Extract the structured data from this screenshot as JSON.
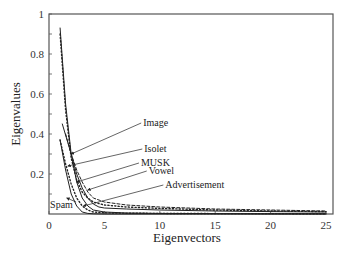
{
  "chart_data": {
    "type": "line",
    "title": "",
    "xlabel": "Eigenvectors",
    "ylabel": "Eigenvalues",
    "xlim": [
      0,
      25
    ],
    "ylim": [
      0,
      1
    ],
    "xticks": [
      0,
      5,
      10,
      15,
      20,
      25
    ],
    "xtick_labels": [
      "0",
      "5",
      "10",
      "15",
      "20",
      "25"
    ],
    "yticks": [
      0.2,
      0.4,
      0.6,
      0.8,
      1
    ],
    "ytick_labels": [
      "0.2",
      "0.4",
      "0.6",
      "0.8",
      "1"
    ],
    "grid": false,
    "legend": "none (inline annotations with arrows)",
    "series": [
      {
        "name": "Image",
        "style": "solid",
        "x": [
          1,
          1.5,
          2,
          2.5,
          3,
          3.5,
          4,
          5,
          7,
          10,
          15,
          20,
          25
        ],
        "y": [
          0.93,
          0.55,
          0.3,
          0.16,
          0.08,
          0.04,
          0.02,
          0.01,
          0.005,
          0.003,
          0.002,
          0.001,
          0.001
        ]
      },
      {
        "name": "Isolet",
        "style": "dotted",
        "x": [
          1,
          1.5,
          2,
          2.5,
          3,
          3.5,
          4,
          5,
          7,
          10,
          15,
          20,
          25
        ],
        "y": [
          0.9,
          0.52,
          0.28,
          0.17,
          0.11,
          0.08,
          0.06,
          0.045,
          0.035,
          0.028,
          0.02,
          0.015,
          0.012
        ]
      },
      {
        "name": "MUSK",
        "style": "solid",
        "x": [
          1.2,
          2,
          2.5,
          3,
          3.5,
          4,
          4.5,
          5,
          7,
          10,
          15,
          20,
          25
        ],
        "y": [
          0.45,
          0.3,
          0.2,
          0.13,
          0.08,
          0.05,
          0.035,
          0.03,
          0.025,
          0.02,
          0.015,
          0.012,
          0.01
        ]
      },
      {
        "name": "Vowel",
        "style": "dashed",
        "x": [
          1.5,
          2,
          2.5,
          3,
          3.5,
          4,
          5,
          7,
          10,
          15,
          20,
          25
        ],
        "y": [
          0.4,
          0.3,
          0.22,
          0.16,
          0.11,
          0.08,
          0.06,
          0.045,
          0.035,
          0.025,
          0.02,
          0.015
        ]
      },
      {
        "name": "Advertisement",
        "style": "dotted",
        "x": [
          1,
          1.5,
          2,
          2.5,
          3,
          3.5,
          4,
          5,
          7,
          10,
          15,
          20,
          25
        ],
        "y": [
          0.37,
          0.25,
          0.15,
          0.08,
          0.04,
          0.02,
          0.01,
          0.006,
          0.004,
          0.003,
          0.002,
          0.002,
          0.001
        ]
      },
      {
        "name": "Spam",
        "style": "solid",
        "x": [
          1,
          1.5,
          2,
          2.5,
          3,
          3.5,
          4,
          5,
          10,
          25
        ],
        "y": [
          0.37,
          0.22,
          0.1,
          0.04,
          0.01,
          0.003,
          0.001,
          0.0,
          0.0,
          0.0
        ]
      }
    ],
    "annotations": [
      {
        "text": "Image",
        "label_xy": [
          8.5,
          0.44
        ],
        "arrow_to": [
          2.0,
          0.3
        ]
      },
      {
        "text": "Isolet",
        "label_xy": [
          8.6,
          0.31
        ],
        "arrow_to": [
          1.7,
          0.24
        ]
      },
      {
        "text": "MUSK",
        "label_xy": [
          8.3,
          0.24
        ],
        "arrow_to": [
          2.5,
          0.16
        ]
      },
      {
        "text": "Vowel",
        "label_xy": [
          9.0,
          0.2
        ],
        "arrow_to": [
          3.5,
          0.12
        ]
      },
      {
        "text": "Advertisement",
        "label_xy": [
          10.5,
          0.13
        ],
        "arrow_to": [
          3.1,
          0.04
        ]
      },
      {
        "text": "Spam",
        "label_xy": [
          0.1,
          0.03
        ],
        "arrow_to": [
          1.6,
          0.08
        ]
      }
    ]
  }
}
